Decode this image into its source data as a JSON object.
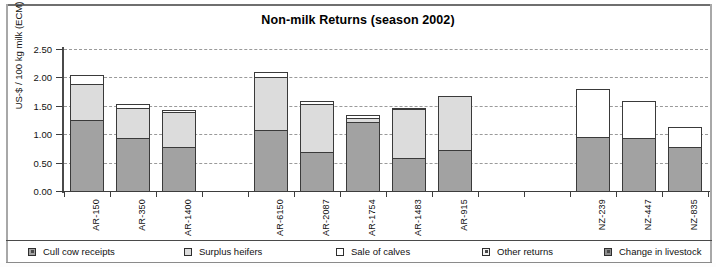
{
  "chart_data": {
    "type": "bar",
    "title": "Non-milk Returns (season 2002)",
    "xlabel": "",
    "ylabel": "US-$ / 100 kg milk (ECM)",
    "ylim": [
      0.0,
      2.5
    ],
    "yticks": [
      "0.00",
      "0.50",
      "1.00",
      "1.50",
      "2.00",
      "2.50"
    ],
    "grid": true,
    "stacked": true,
    "legend_position": "bottom",
    "categories": [
      "AR-150",
      "AR-350",
      "AR-1400",
      "",
      "AR-6150",
      "AR-2087",
      "AR-1754",
      "AR-1483",
      "AR-915",
      "",
      "",
      "NZ-239",
      "NZ-447",
      "NZ-835"
    ],
    "series": [
      {
        "name": "Cull cow receipts",
        "color": "#a2a2a2",
        "values": [
          1.25,
          0.94,
          0.78,
          null,
          1.08,
          0.68,
          1.21,
          0.58,
          0.73,
          null,
          null,
          0.95,
          0.93,
          0.78
        ]
      },
      {
        "name": "Surplus heifers",
        "color": "#dcdcdc",
        "values": [
          0.63,
          0.53,
          0.61,
          null,
          0.93,
          0.85,
          0.08,
          0.87,
          0.95,
          null,
          null,
          0.0,
          0.0,
          0.0
        ]
      },
      {
        "name": "Sale of calves",
        "color": "#ffffff",
        "values": [
          0.16,
          0.06,
          0.04,
          null,
          0.09,
          0.05,
          0.04,
          0.01,
          0.0,
          null,
          null,
          0.84,
          0.65,
          0.34
        ]
      },
      {
        "name": "Other returns",
        "color": "#f2f2f2",
        "values": [
          0.0,
          0.0,
          0.0,
          null,
          0.0,
          0.0,
          0.0,
          0.0,
          0.0,
          null,
          null,
          0.0,
          0.0,
          0.0
        ]
      },
      {
        "name": "Change in livestock",
        "color": "#8e8e8e",
        "values": [
          0.0,
          0.0,
          0.0,
          null,
          0.0,
          0.0,
          0.0,
          0.0,
          0.0,
          null,
          null,
          0.0,
          0.0,
          0.0
        ]
      }
    ],
    "totals": [
      2.04,
      1.53,
      1.43,
      null,
      2.1,
      1.58,
      1.33,
      1.46,
      1.68,
      null,
      null,
      1.79,
      1.58,
      1.12
    ]
  },
  "legend": {
    "items": [
      {
        "label": "Cull cow receipts",
        "icon": "legend-swatch-icon"
      },
      {
        "label": "Surplus heifers",
        "icon": "legend-swatch-icon"
      },
      {
        "label": "Sale of calves",
        "icon": "legend-swatch-icon"
      },
      {
        "label": "Other returns",
        "icon": "legend-swatch-icon"
      },
      {
        "label": "Change in livestock",
        "icon": "legend-swatch-icon"
      }
    ]
  }
}
